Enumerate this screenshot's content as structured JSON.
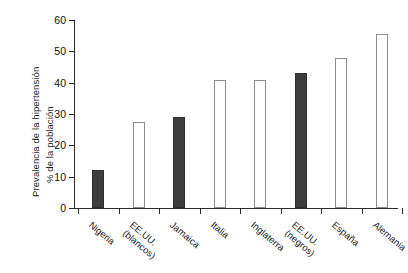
{
  "chart_data": {
    "type": "bar",
    "title": "",
    "subtitle": "",
    "xlabel": "",
    "ylabel": "Prevalencia de la hipertensión % de la población",
    "ylabel_lines": [
      "Prevalencia de la hipertensión",
      "% de la población"
    ],
    "categories": [
      "Nigeria",
      "EE.UU. (blancos)",
      "Jamaica",
      "Italia",
      "Inglaterra",
      "EE.UU. (negros)",
      "España",
      "Alemania"
    ],
    "category_lines": [
      [
        "Nigeria",
        ""
      ],
      [
        "EE.UU.",
        "(blancos)"
      ],
      [
        "Jamaica",
        ""
      ],
      [
        "Italia",
        ""
      ],
      [
        "Inglaterra",
        ""
      ],
      [
        "EE.UU.",
        "(negros)"
      ],
      [
        "España",
        ""
      ],
      [
        "Alemania",
        ""
      ]
    ],
    "values": [
      12,
      27.5,
      29,
      41,
      41,
      43,
      48,
      55.5
    ],
    "bar_styles": [
      "filled",
      "open",
      "filled",
      "open",
      "open",
      "filled",
      "open",
      "open"
    ],
    "ylim": [
      0,
      60
    ],
    "yticks": [
      0,
      10,
      20,
      30,
      40,
      50,
      60
    ],
    "ytick_labels": [
      "0",
      "10",
      "20",
      "30",
      "40",
      "50",
      "60"
    ],
    "grid": false,
    "legend": null,
    "colors": {
      "bar_filled": "#3d3d3d",
      "bar_open_edge": "#8d8d8d",
      "axis": "#2a2a2a",
      "text": "#1c1c1c",
      "background": "#ffffff"
    }
  }
}
